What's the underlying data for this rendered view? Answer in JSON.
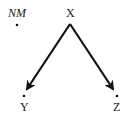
{
  "diagram": {
    "type": "directed-graph",
    "nodes": [
      {
        "id": "NM",
        "label": "NM",
        "italic": true,
        "x": 17,
        "y": 25
      },
      {
        "id": "X",
        "label": "X",
        "italic": false,
        "x": 70,
        "y": 25
      },
      {
        "id": "Y",
        "label": "Y",
        "italic": false,
        "x": 24,
        "y": 96
      },
      {
        "id": "Z",
        "label": "Z",
        "italic": false,
        "x": 117,
        "y": 96
      }
    ],
    "edges": [
      {
        "from": "X",
        "to": "Y"
      },
      {
        "from": "X",
        "to": "Z"
      }
    ],
    "colors": {
      "stroke": "#111111",
      "text": "#1a1a1a",
      "background": "#ffffff"
    }
  }
}
